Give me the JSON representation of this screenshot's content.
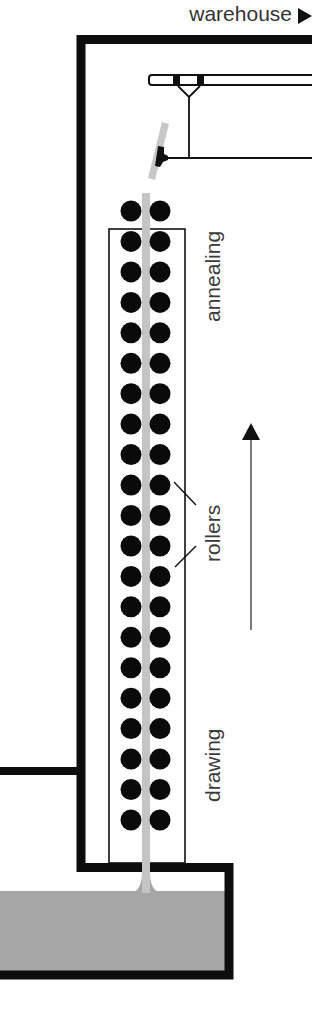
{
  "diagram": {
    "labels": {
      "destination": "warehouse",
      "annealing": "annealing",
      "rollers": "rollers",
      "drawing": "drawing"
    },
    "icons": {
      "destination_arrow": "triangle-right-icon",
      "direction_arrow": "arrow-up-icon"
    },
    "roller_rows": 21,
    "colors": {
      "wall": "#0d0d0d",
      "glass": "#c4c4c4",
      "molten_glass": "#a6a6a6",
      "roller": "#0a0a0a",
      "text": "#3a3a3a"
    }
  }
}
